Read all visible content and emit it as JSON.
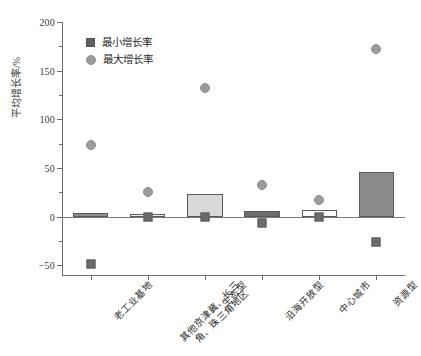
{
  "chart_data": {
    "type": "bar",
    "title": "",
    "xlabel": "",
    "ylabel": "平均增长率/%",
    "ylim": [
      -60,
      200
    ],
    "yticks": [
      200,
      150,
      100,
      50,
      0,
      -50
    ],
    "grid": false,
    "legend_position": "top-left",
    "categories": [
      "老工业基地",
      "其他京津冀、长三角、珠三角地区",
      "生态型",
      "沿海开放型",
      "中心城市",
      "资源型"
    ],
    "category_lines": [
      [
        "老工业基地"
      ],
      [
        "其他京津冀、长三",
        "角、珠三角地区"
      ],
      [
        "生态型"
      ],
      [
        "沿海开放型"
      ],
      [
        "中心城市"
      ],
      [
        "资源型"
      ]
    ],
    "series": [
      {
        "name": "平均增长率",
        "type": "bar",
        "values": [
          4,
          3,
          23,
          6,
          7,
          46
        ],
        "colors": [
          "#8f8f8f",
          "#f2f2f2",
          "#d9d9d9",
          "#6e6e6e",
          "#fbfbfb",
          "#8a8a8a"
        ]
      },
      {
        "name": "最小增长率",
        "type": "scatter",
        "marker": "square",
        "values": [
          -49,
          0,
          0,
          -7,
          0,
          -26
        ],
        "color": "#6b6b6b"
      },
      {
        "name": "最大增长率",
        "type": "scatter",
        "marker": "circle",
        "values": [
          74,
          25,
          132,
          33,
          17,
          172
        ],
        "color": "#9c9c9c"
      }
    ]
  },
  "legend": {
    "items": [
      {
        "label": "最小增长率",
        "marker": "square",
        "color": "#5f5f5f"
      },
      {
        "label": "最大增长率",
        "marker": "circle",
        "color": "#9c9c9c"
      }
    ]
  },
  "axis": {
    "y_title": "平均增长率/%",
    "y_tick_labels": [
      "200",
      "150",
      "100",
      "50",
      "0",
      "−50"
    ]
  }
}
